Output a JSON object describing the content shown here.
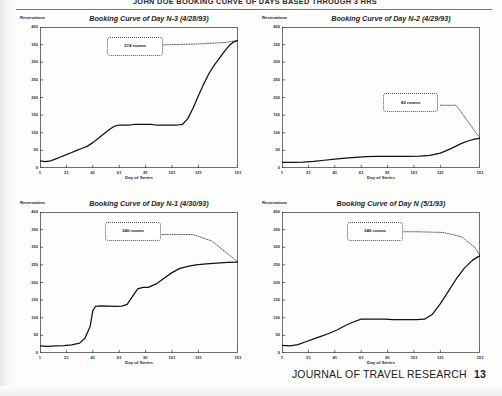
{
  "page": {
    "running_head": "JOHN DOE BOOKING CURVE OF DAYS BASED THROUGH 3 HRS",
    "footer_journal": "JOURNAL OF TRAVEL RESEARCH",
    "footer_page": "13"
  },
  "axes": {
    "ylabel": "Reservations",
    "xlabel": "Day of Series",
    "yticks": [
      "400",
      "350",
      "300",
      "250",
      "200",
      "150",
      "100",
      "50",
      "0"
    ],
    "ytick_values": [
      400,
      350,
      300,
      250,
      200,
      150,
      100,
      50,
      0
    ],
    "xticks": [
      "1",
      "21",
      "41",
      "61",
      "81",
      "101",
      "121",
      "151"
    ],
    "xtick_values": [
      1,
      21,
      41,
      61,
      81,
      101,
      121,
      151
    ],
    "ylim": [
      0,
      400
    ],
    "xlim": [
      1,
      151
    ],
    "grid": false
  },
  "chart_data": [
    {
      "type": "line",
      "id": "day-n-minus-3",
      "title": "Booking Curve of Day N-3 (4/28/93)",
      "xlabel": "Day of Series",
      "ylabel": "Reservations",
      "xlim": [
        1,
        151
      ],
      "ylim": [
        0,
        400
      ],
      "annotation": "374 rooms",
      "annotation_value": 374,
      "legend": [],
      "series": [
        {
          "name": "Reservations on hand",
          "style": "solid",
          "x": [
            1,
            5,
            9,
            13,
            17,
            21,
            25,
            29,
            33,
            37,
            41,
            45,
            49,
            53,
            57,
            61,
            65,
            69,
            73,
            77,
            81,
            85,
            89,
            93,
            97,
            101,
            105,
            109,
            113,
            117,
            121,
            125,
            129,
            133,
            137,
            141,
            145,
            148,
            151
          ],
          "y": [
            20,
            18,
            20,
            26,
            32,
            38,
            44,
            50,
            56,
            62,
            72,
            84,
            96,
            108,
            118,
            122,
            122,
            122,
            124,
            124,
            124,
            124,
            122,
            122,
            122,
            122,
            122,
            124,
            140,
            170,
            205,
            238,
            268,
            292,
            312,
            332,
            350,
            358,
            362
          ]
        },
        {
          "name": "Capacity reference",
          "style": "dotted",
          "x": [
            61,
            81,
            101,
            121,
            141,
            151
          ],
          "y": [
            352,
            348,
            350,
            352,
            356,
            362
          ]
        }
      ],
      "callout_box": {
        "left_pct": 34,
        "top_pct": 7,
        "width_pct": 26,
        "height_pct": 12
      }
    },
    {
      "type": "line",
      "id": "day-n-minus-2",
      "title": "Booking Curve of Day N-2 (4/29/93)",
      "xlabel": "Day of Series",
      "ylabel": "Reservations",
      "xlim": [
        1,
        151
      ],
      "ylim": [
        0,
        400
      ],
      "annotation": "82 rooms",
      "annotation_value": 82,
      "legend": [],
      "series": [
        {
          "name": "Reservations on hand",
          "style": "solid",
          "x": [
            1,
            9,
            17,
            25,
            33,
            41,
            49,
            57,
            65,
            73,
            81,
            89,
            97,
            105,
            113,
            121,
            129,
            137,
            143,
            147,
            151
          ],
          "y": [
            16,
            16,
            17,
            19,
            22,
            25,
            28,
            30,
            32,
            33,
            33,
            33,
            33,
            34,
            36,
            42,
            55,
            70,
            78,
            82,
            84
          ]
        },
        {
          "name": "Capacity reference",
          "style": "dotted",
          "x": [
            121,
            133,
            151
          ],
          "y": [
            178,
            178,
            84
          ]
        }
      ],
      "callout_box": {
        "left_pct": 51,
        "top_pct": 47,
        "width_pct": 26,
        "height_pct": 12
      }
    },
    {
      "type": "line",
      "id": "day-n-minus-1",
      "title": "Booking Curve of Day N-1 (4/30/93)",
      "xlabel": "Day of Series",
      "ylabel": "Reservations",
      "xlim": [
        1,
        151
      ],
      "ylim": [
        0,
        400
      ],
      "annotation": "340 rooms",
      "annotation_value": 340,
      "legend": [],
      "series": [
        {
          "name": "Reservations on hand",
          "style": "solid",
          "x": [
            1,
            7,
            13,
            19,
            25,
            31,
            35,
            39,
            41,
            43,
            47,
            53,
            59,
            63,
            67,
            71,
            75,
            79,
            83,
            89,
            95,
            101,
            107,
            113,
            119,
            127,
            135,
            143,
            151
          ],
          "y": [
            20,
            19,
            20,
            21,
            23,
            28,
            42,
            75,
            120,
            132,
            134,
            133,
            132,
            133,
            138,
            160,
            182,
            186,
            186,
            196,
            212,
            228,
            240,
            246,
            250,
            253,
            255,
            257,
            258
          ]
        },
        {
          "name": "Capacity reference",
          "style": "dotted",
          "x": [
            61,
            81,
            101,
            117,
            131,
            151
          ],
          "y": [
            336,
            336,
            336,
            336,
            318,
            258
          ]
        }
      ],
      "callout_box": {
        "left_pct": 33,
        "top_pct": 7,
        "width_pct": 26,
        "height_pct": 12
      }
    },
    {
      "type": "line",
      "id": "day-n",
      "title": "Booking Curve of Day N (5/1/93)",
      "xlabel": "Day of Series",
      "ylabel": "Reservations",
      "xlim": [
        1,
        151
      ],
      "ylim": [
        0,
        400
      ],
      "annotation": "346 rooms",
      "annotation_value": 346,
      "legend": [],
      "series": [
        {
          "name": "Reservations on hand",
          "style": "solid",
          "x": [
            1,
            7,
            13,
            19,
            25,
            31,
            37,
            43,
            49,
            55,
            61,
            67,
            73,
            79,
            85,
            91,
            97,
            103,
            109,
            115,
            121,
            127,
            133,
            139,
            145,
            149,
            151
          ],
          "y": [
            22,
            20,
            24,
            32,
            40,
            48,
            56,
            66,
            78,
            88,
            96,
            96,
            96,
            96,
            95,
            95,
            95,
            95,
            96,
            110,
            140,
            175,
            210,
            240,
            262,
            272,
            276
          ]
        },
        {
          "name": "Capacity reference",
          "style": "dotted",
          "x": [
            63,
            83,
            103,
            123,
            137,
            147,
            151
          ],
          "y": [
            344,
            344,
            344,
            342,
            330,
            300,
            276
          ]
        }
      ],
      "callout_box": {
        "left_pct": 33,
        "top_pct": 7,
        "width_pct": 26,
        "height_pct": 12
      }
    }
  ]
}
